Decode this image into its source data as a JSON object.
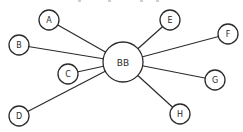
{
  "diagram": {
    "type": "star-graph",
    "hub": {
      "id": "BB",
      "label": "BB"
    },
    "nodes": [
      {
        "id": "A",
        "label": "A"
      },
      {
        "id": "B",
        "label": "B"
      },
      {
        "id": "C",
        "label": "C"
      },
      {
        "id": "D",
        "label": "D"
      },
      {
        "id": "E",
        "label": "E"
      },
      {
        "id": "F",
        "label": "F"
      },
      {
        "id": "G",
        "label": "G"
      },
      {
        "id": "H",
        "label": "H"
      }
    ],
    "edges": [
      {
        "from": "BB",
        "to": "A"
      },
      {
        "from": "BB",
        "to": "B"
      },
      {
        "from": "BB",
        "to": "C"
      },
      {
        "from": "BB",
        "to": "D"
      },
      {
        "from": "BB",
        "to": "E"
      },
      {
        "from": "BB",
        "to": "F"
      },
      {
        "from": "BB",
        "to": "G"
      },
      {
        "from": "BB",
        "to": "H"
      }
    ],
    "colors": {
      "stroke": "#2a2a2a",
      "background": "#ffffff"
    }
  }
}
